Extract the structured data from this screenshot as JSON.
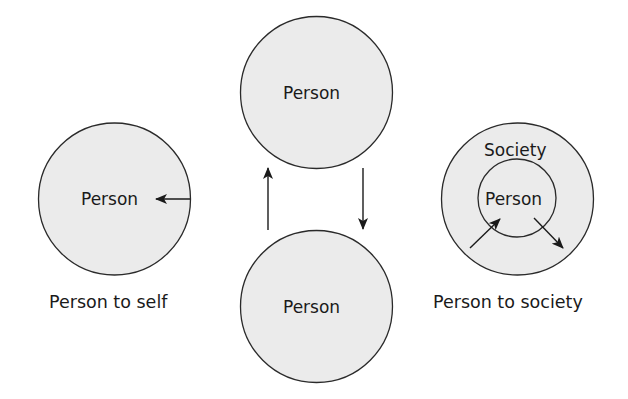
{
  "colors": {
    "background": "#ffffff",
    "circle_fill": "#ebebeb",
    "stroke": "#2a2a2a",
    "text": "#1a1a1a"
  },
  "panels": {
    "self": {
      "circle_label": "Person",
      "caption": "Person to self",
      "arrow": "arrow-left-icon"
    },
    "person": {
      "top_label": "Person",
      "bottom_label": "Person",
      "arrows": [
        "arrow-up-icon",
        "arrow-down-icon"
      ]
    },
    "society": {
      "outer_label": "Society",
      "inner_label": "Person",
      "caption": "Person to society",
      "arrows": [
        "arrow-in-icon",
        "arrow-out-icon"
      ]
    }
  }
}
